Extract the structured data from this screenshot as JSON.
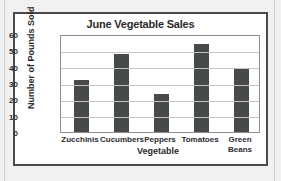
{
  "chart_data": {
    "type": "bar",
    "title": "June Vegetable Sales",
    "xlabel": "Vegetable",
    "ylabel": "Number of Pounds Sold",
    "categories": [
      "Zucchinis",
      "Cucumbers",
      "Peppers",
      "Tomatoes",
      "Green\nBeans"
    ],
    "values": [
      32,
      48,
      23,
      54,
      39
    ],
    "ylim": [
      0,
      60
    ],
    "yticks": [
      "0",
      "10",
      "20",
      "30",
      "40",
      "50",
      "60"
    ],
    "grid": true,
    "legend": "none",
    "bar_color": "#464a4a",
    "grid_color": "#c4c4c4",
    "frame_color": "#4a4a4a",
    "background": "#ffffff"
  }
}
